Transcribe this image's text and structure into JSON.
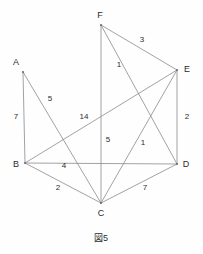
{
  "figure": {
    "caption": "図5",
    "caption_x": 101,
    "caption_y": 238,
    "width": 203,
    "height": 254,
    "background_color": "#fefefe",
    "edge_color": "#8a8a8a",
    "text_color": "#2b2b2b"
  },
  "chart_data": {
    "type": "diagram",
    "title": "図5",
    "subtitle": "",
    "nodes": [
      {
        "id": "A",
        "label": "A",
        "x": 23,
        "y": 72,
        "label_x": 16,
        "label_y": 62
      },
      {
        "id": "B",
        "label": "B",
        "x": 25,
        "y": 163,
        "label_x": 16,
        "label_y": 164
      },
      {
        "id": "C",
        "label": "C",
        "x": 101,
        "y": 203,
        "label_x": 101,
        "label_y": 213
      },
      {
        "id": "D",
        "label": "D",
        "x": 177,
        "y": 164,
        "label_x": 186,
        "label_y": 164
      },
      {
        "id": "E",
        "label": "E",
        "x": 177,
        "y": 70,
        "label_x": 187,
        "label_y": 69
      },
      {
        "id": "F",
        "label": "F",
        "x": 101,
        "y": 25,
        "label_x": 100,
        "label_y": 15
      }
    ],
    "edges": [
      {
        "from": "A",
        "to": "B",
        "weight": "7",
        "label_x": 16,
        "label_y": 117
      },
      {
        "from": "A",
        "to": "C",
        "weight": "5",
        "label_x": 50,
        "label_y": 99
      },
      {
        "from": "B",
        "to": "C",
        "weight": "2",
        "label_x": 58,
        "label_y": 188
      },
      {
        "from": "B",
        "to": "D",
        "weight": "4",
        "label_x": 64,
        "label_y": 166
      },
      {
        "from": "B",
        "to": "E",
        "weight": "14",
        "label_x": 84,
        "label_y": 117
      },
      {
        "from": "C",
        "to": "D",
        "weight": "7",
        "label_x": 145,
        "label_y": 188
      },
      {
        "from": "C",
        "to": "E",
        "weight": "1",
        "label_x": 143,
        "label_y": 143
      },
      {
        "from": "C",
        "to": "F",
        "weight": "5",
        "label_x": 108,
        "label_y": 140
      },
      {
        "from": "D",
        "to": "E",
        "weight": "2",
        "label_x": 187,
        "label_y": 117
      },
      {
        "from": "D",
        "to": "F",
        "weight": "1",
        "label_x": 119,
        "label_y": 65
      },
      {
        "from": "E",
        "to": "F",
        "weight": "3",
        "label_x": 142,
        "label_y": 40
      }
    ],
    "xlabel": "",
    "ylabel": "",
    "legend": [],
    "grid": false
  }
}
